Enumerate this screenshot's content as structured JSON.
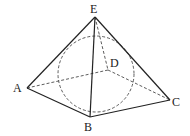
{
  "diagram": {
    "title": "",
    "type": "pyramid-inscribed-sphere",
    "labels": {
      "E": "E",
      "A": "A",
      "B": "B",
      "C": "C",
      "D": "D"
    },
    "vertices": {
      "E": [
        95,
        17
      ],
      "A": [
        27,
        88
      ],
      "B": [
        90,
        117
      ],
      "C": [
        170,
        100
      ],
      "D": [
        108,
        70
      ]
    },
    "sphere": {
      "cx": 96,
      "cy": 74,
      "r": 38
    },
    "colors": {
      "stroke": "#222222",
      "background": "#ffffff"
    }
  }
}
